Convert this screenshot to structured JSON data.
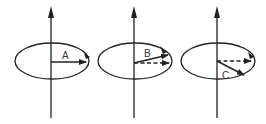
{
  "diagram": {
    "stroke_color": "#222222",
    "panels": [
      {
        "id": "A",
        "label": "A",
        "axis_x": 51,
        "ellipse": {
          "cx": 52,
          "cy": 61,
          "rx": 37,
          "ry": 18
        },
        "solid_vector": {
          "x1": 51,
          "y1": 62,
          "x2": 85,
          "y2": 62
        },
        "dashed_vector": null,
        "label_pos": {
          "x": 61,
          "y": 59
        }
      },
      {
        "id": "B",
        "label": "B",
        "axis_x": 134,
        "ellipse": {
          "cx": 135,
          "cy": 61,
          "rx": 37,
          "ry": 18
        },
        "solid_vector": {
          "x1": 134,
          "y1": 63,
          "x2": 168,
          "y2": 55
        },
        "dashed_vector": {
          "x1": 134,
          "y1": 63,
          "x2": 168,
          "y2": 63
        },
        "label_pos": {
          "x": 143,
          "y": 57
        }
      },
      {
        "id": "C",
        "label": "C",
        "axis_x": 217,
        "ellipse": {
          "cx": 218,
          "cy": 61,
          "rx": 37,
          "ry": 18
        },
        "solid_vector": {
          "x1": 217,
          "y1": 61,
          "x2": 244,
          "y2": 75
        },
        "dashed_vector": {
          "x1": 217,
          "y1": 61,
          "x2": 250,
          "y2": 61
        },
        "label_pos": {
          "x": 222,
          "y": 78
        }
      }
    ]
  }
}
